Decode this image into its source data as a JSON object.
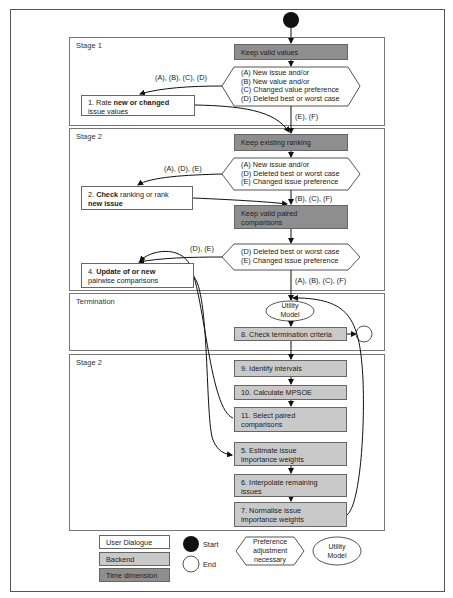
{
  "stages": {
    "stage1": "Stage 1",
    "stage2": "Stage 2",
    "termination": "Termination",
    "stage2b": "Stage 2"
  },
  "nodes": {
    "keep_valid_values": "Keep valid values",
    "hex1": [
      "(A) New issue and/or",
      "(B) New value and/or",
      "(C) Changed value preference",
      "(D) Deleted best or worst case"
    ],
    "box1_pre": "1. Rate ",
    "box1_bold": "new or changed",
    "box1_post": "issue values",
    "keep_existing_ranking": "Keep existing ranking",
    "hex2": [
      "(A) New issue and/or",
      "(D) Deleted best or worst case",
      "(E) Changed issue preference"
    ],
    "box2_pre": "2. ",
    "box2_bold1": "Check",
    "box2_mid": " ranking or rank",
    "box2_bold2": "new issue",
    "keep_valid_paired_1": "Keep valid paired",
    "keep_valid_paired_2": "comparisons",
    "hex3": [
      "(D) Deleted best or worst case",
      "(E) Changed issue preference"
    ],
    "box4_pre": "4. ",
    "box4_bold": "Update of or new",
    "box4_post": "pairwise comparisons",
    "utility_model_1": "Utility",
    "utility_model_2": "Model",
    "box8": "8. Check termination criteria",
    "box9": "9. Identify intervals",
    "box10": "10. Calculate MPSOE",
    "box11_1": "11. Select paired",
    "box11_2": "comparisons",
    "box5_1": "5. Estimate issue",
    "box5_2": "importance weights",
    "box6_1": "6. Interpolate remaining",
    "box6_2": "issues",
    "box7_1": "7. Normalise issue",
    "box7_2": "importance weights"
  },
  "edge_labels": {
    "hex1_left": "(A), (B), (C), (D)",
    "hex1_down": "(E), (F)",
    "hex2_left": "(A), (D), (E)",
    "hex2_down": "(B), (C), (F)",
    "hex3_left": "(D), (E)",
    "hex3_down": "(A), (B), (C), (F)"
  },
  "legend": {
    "user_dialogue": "User Dialogue",
    "backend": "Backend",
    "time_dimension": "Time dimension",
    "start": "Start",
    "end": "End",
    "preference_1": "Preference",
    "preference_2": "adjustment",
    "preference_3": "necessary",
    "utility_1": "Utility",
    "utility_2": "Model"
  },
  "colors": {
    "user_dialogue": "#ffffff",
    "backend": "#c9c9c9",
    "time_dimension": "#8e8e8e",
    "start": "#111111"
  }
}
